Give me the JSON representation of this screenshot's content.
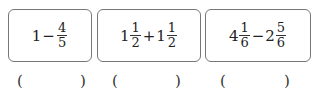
{
  "problems": [
    {
      "terms": [
        {
          "whole": "1",
          "num": "",
          "den": ""
        },
        {
          "whole": "",
          "num": "4",
          "den": "5"
        }
      ],
      "operator": "−",
      "answer_open": "(",
      "answer_close": ")"
    },
    {
      "terms": [
        {
          "whole": "1",
          "num": "1",
          "den": "2"
        },
        {
          "whole": "1",
          "num": "1",
          "den": "2"
        }
      ],
      "operator": "+",
      "answer_open": "(",
      "answer_close": ")"
    },
    {
      "terms": [
        {
          "whole": "4",
          "num": "1",
          "den": "6"
        },
        {
          "whole": "2",
          "num": "5",
          "den": "6"
        }
      ],
      "operator": "−",
      "answer_open": "(",
      "answer_close": ")"
    }
  ]
}
